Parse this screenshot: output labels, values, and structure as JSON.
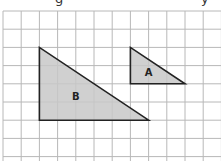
{
  "diagram": {
    "type": "grid-triangles",
    "top_text_fragments": [
      "g",
      "y"
    ],
    "grid": {
      "origin_x": 3,
      "origin_y": 11,
      "cell_size": 18.2,
      "columns": 12,
      "rows": 9,
      "line_color": "#b8b8b8"
    },
    "shapes": [
      {
        "label": "B",
        "vertices_grid": [
          [
            2,
            2
          ],
          [
            2,
            6
          ],
          [
            8,
            6
          ]
        ],
        "fill": "#c8c8c8",
        "stroke": "#222222"
      },
      {
        "label": "A",
        "vertices_grid": [
          [
            7,
            2
          ],
          [
            7,
            4
          ],
          [
            10,
            4
          ]
        ],
        "fill": "#c8c8c8",
        "stroke": "#222222"
      }
    ]
  }
}
